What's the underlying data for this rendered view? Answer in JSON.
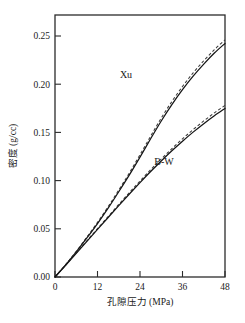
{
  "chart_data": {
    "type": "line",
    "title": "",
    "xlabel": "孔隙压力 (MPa)",
    "ylabel": "密度 (g/cc)",
    "xlim": [
      0,
      48
    ],
    "ylim": [
      0,
      0.272
    ],
    "xticks": [
      0,
      12,
      24,
      36,
      48
    ],
    "xtick_labels": [
      "0",
      "12",
      "24",
      "36",
      "48"
    ],
    "yticks": [
      0.0,
      0.05,
      0.1,
      0.15,
      0.2,
      0.25
    ],
    "ytick_labels": [
      "0.00",
      "0.05",
      "0.10",
      "0.15",
      "0.20",
      "0.25"
    ],
    "grid": false,
    "legend_position": "inline-annotation",
    "x": [
      0,
      3,
      6,
      9,
      12,
      15,
      18,
      21,
      24,
      27,
      30,
      33,
      36,
      39,
      42,
      45,
      48
    ],
    "series": [
      {
        "name": "Xu",
        "style": "solid",
        "label_text": "Xu",
        "values": [
          0.0,
          0.0125,
          0.026,
          0.0405,
          0.0555,
          0.0715,
          0.0885,
          0.106,
          0.1245,
          0.1435,
          0.162,
          0.179,
          0.1945,
          0.2085,
          0.221,
          0.2325,
          0.2425
        ]
      },
      {
        "name": "Xu (dashed variant)",
        "style": "dashed",
        "label_text": "",
        "values": [
          0.0,
          0.0128,
          0.0266,
          0.0414,
          0.0567,
          0.073,
          0.0903,
          0.1081,
          0.1269,
          0.1462,
          0.165,
          0.1822,
          0.1978,
          0.2119,
          0.2245,
          0.236,
          0.2462
        ]
      },
      {
        "name": "B-W",
        "style": "solid",
        "label_text": "B-W",
        "values": [
          0.0,
          0.0122,
          0.0246,
          0.037,
          0.0494,
          0.0618,
          0.0741,
          0.0862,
          0.098,
          0.1095,
          0.1205,
          0.131,
          0.141,
          0.1504,
          0.1592,
          0.1674,
          0.175
        ]
      },
      {
        "name": "B-W (dashed variant)",
        "style": "dashed",
        "label_text": "",
        "values": [
          0.0,
          0.0124,
          0.025,
          0.0376,
          0.0502,
          0.0628,
          0.0753,
          0.0876,
          0.0996,
          0.1113,
          0.1225,
          0.1332,
          0.1434,
          0.153,
          0.162,
          0.1704,
          0.1782
        ]
      }
    ],
    "annotations": [
      {
        "text": "Xu",
        "x": 18.0,
        "y": 0.212
      },
      {
        "text": "B-W",
        "x": 29.0,
        "y": 0.122
      }
    ],
    "endpoint_values": {
      "Xu_at_48": 0.262,
      "B-W_at_48": 0.194
    }
  }
}
